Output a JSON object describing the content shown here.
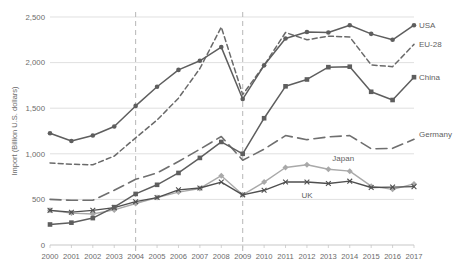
{
  "chart_data": {
    "type": "line",
    "title": "",
    "xlabel": "",
    "ylabel": "Import (Billion U.S. dollars)",
    "ylim": [
      0,
      2500
    ],
    "yticks": [
      0,
      500,
      1000,
      1500,
      2000,
      2500
    ],
    "ytick_labels": [
      "0",
      "500",
      "1,000",
      "1,500",
      "2,000",
      "2,500"
    ],
    "grid": true,
    "legend_position": "right-inline",
    "annotations": [
      {
        "label": "vertical reference line",
        "x": "2004"
      },
      {
        "label": "vertical reference line",
        "x": "2009"
      }
    ],
    "categories": [
      "2000",
      "2001",
      "2002",
      "2003",
      "2004",
      "2005",
      "2006",
      "2007",
      "2008",
      "2009",
      "2010",
      "2011",
      "2012",
      "2013",
      "2014",
      "2015",
      "2016",
      "2017"
    ],
    "series": [
      {
        "name": "USA",
        "marker": "circle",
        "style": "solid",
        "color": "#5e5e5e",
        "values": [
          1225,
          1140,
          1200,
          1300,
          1525,
          1735,
          1920,
          2020,
          2170,
          1600,
          1970,
          2265,
          2335,
          2330,
          2410,
          2315,
          2250,
          2410
        ]
      },
      {
        "name": "EU-28",
        "marker": "none",
        "style": "short-dash",
        "color": "#6a6a6a",
        "values": [
          900,
          885,
          880,
          975,
          1175,
          1370,
          1610,
          1935,
          2390,
          1650,
          1970,
          2330,
          2250,
          2290,
          2280,
          1975,
          1955,
          2200
        ]
      },
      {
        "name": "China",
        "marker": "square",
        "style": "solid",
        "color": "#5e5e5e",
        "values": [
          225,
          245,
          295,
          415,
          560,
          660,
          790,
          955,
          1130,
          1000,
          1390,
          1740,
          1815,
          1950,
          1955,
          1680,
          1590,
          1840
        ]
      },
      {
        "name": "Germany",
        "marker": "none",
        "style": "long-dash",
        "color": "#6f6f6f",
        "values": [
          500,
          490,
          490,
          600,
          720,
          790,
          915,
          1050,
          1190,
          930,
          1050,
          1200,
          1155,
          1185,
          1200,
          1055,
          1060,
          1160
        ]
      },
      {
        "name": "Japan",
        "marker": "diamond",
        "style": "solid",
        "color": "#a9a9a9",
        "values": [
          380,
          350,
          340,
          385,
          455,
          520,
          580,
          620,
          760,
          550,
          690,
          850,
          880,
          830,
          810,
          645,
          610,
          670
        ]
      },
      {
        "name": "UK",
        "marker": "cross",
        "style": "solid",
        "color": "#4f4f4f",
        "values": [
          380,
          360,
          380,
          410,
          475,
          520,
          605,
          625,
          690,
          550,
          600,
          690,
          690,
          675,
          700,
          630,
          635,
          640
        ]
      }
    ]
  }
}
